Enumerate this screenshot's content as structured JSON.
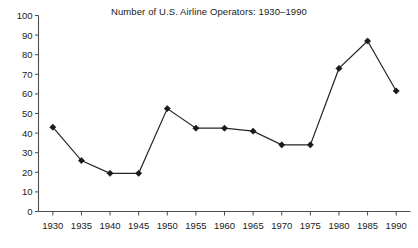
{
  "chart_data": {
    "type": "line",
    "title": "Number of U.S. Airline Operators: 1930–1990",
    "xlabel": "",
    "ylabel": "",
    "x": [
      1930,
      1935,
      1940,
      1945,
      1950,
      1955,
      1960,
      1965,
      1970,
      1975,
      1980,
      1985,
      1990
    ],
    "categories": [
      "1930",
      "1935",
      "1940",
      "1945",
      "1950",
      "1955",
      "1960",
      "1965",
      "1970",
      "1975",
      "1980",
      "1985",
      "1990"
    ],
    "values": [
      43,
      26,
      19.5,
      19.5,
      52.5,
      42.5,
      42.5,
      41,
      34,
      34,
      73,
      87,
      61.5
    ],
    "xlim": [
      1927.5,
      1992.5
    ],
    "ylim": [
      0,
      100
    ],
    "y_ticks": [
      0,
      10,
      20,
      30,
      40,
      50,
      60,
      70,
      80,
      90,
      100
    ],
    "y_tick_labels": [
      "0",
      "10",
      "20",
      "30",
      "40",
      "50",
      "60",
      "70",
      "80",
      "90",
      "100"
    ],
    "x_ticks": [
      1930,
      1935,
      1940,
      1945,
      1950,
      1955,
      1960,
      1965,
      1970,
      1975,
      1980,
      1985,
      1990
    ],
    "x_tick_labels": [
      "1930",
      "1935",
      "1940",
      "1945",
      "1950",
      "1955",
      "1960",
      "1965",
      "1970",
      "1975",
      "1980",
      "1985",
      "1990"
    ],
    "grid": false,
    "legend": false,
    "legend_position": "none",
    "marker": "diamond",
    "line_color": "#262626",
    "marker_color": "#1a1a1a",
    "axis_color": "#4d4d4d",
    "background_color": "#ffffff"
  }
}
